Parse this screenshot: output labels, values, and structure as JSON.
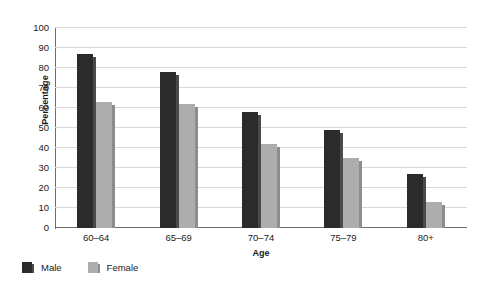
{
  "chart_data": {
    "type": "bar",
    "title": "",
    "xlabel": "Age",
    "ylabel": "Percentage",
    "categories": [
      "60–64",
      "65–69",
      "70–74",
      "75–79",
      "80+"
    ],
    "series": [
      {
        "name": "Male",
        "color": "#2b2b2b",
        "values": [
          87,
          78,
          58,
          49,
          27
        ]
      },
      {
        "name": "Female",
        "color": "#adadad",
        "values": [
          63,
          62,
          42,
          35,
          13
        ]
      }
    ],
    "ylim": [
      0,
      100
    ],
    "ytick_step": 10,
    "ytick_labels": [
      "0",
      "10",
      "20",
      "30",
      "40",
      "50",
      "60",
      "70",
      "80",
      "90",
      "100"
    ],
    "grid": true,
    "legend_position": "bottom-left"
  }
}
